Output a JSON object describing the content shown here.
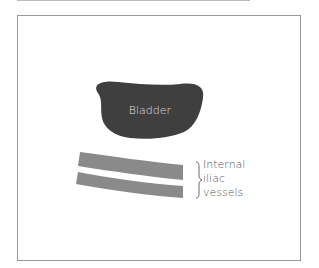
{
  "diagram": {
    "labels": {
      "bladder": "Bladder",
      "vessels_line1": "Internal",
      "vessels_line2": "iliac",
      "vessels_line3": "vessels"
    },
    "colors": {
      "bladder_fill": "#3f3f3f",
      "vessel_fill": "#8a8a8a",
      "frame_border": "#9a9a9a",
      "label_text": "#555555",
      "bladder_text": "#e0e0e0"
    }
  }
}
